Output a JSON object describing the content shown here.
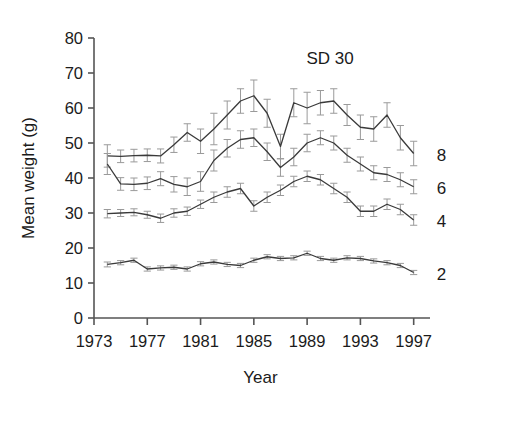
{
  "chart_data": {
    "type": "line",
    "title": "",
    "annotation": "SD 30",
    "xlabel": "Year",
    "ylabel": "Mean weight (g)",
    "xlim": [
      1973,
      1998
    ],
    "ylim": [
      0,
      80
    ],
    "ytick_values": [
      0,
      10,
      20,
      30,
      40,
      50,
      60,
      70,
      80
    ],
    "ytick_labels": [
      "0",
      "10",
      "20",
      "30",
      "40",
      "50",
      "60",
      "70",
      "80"
    ],
    "xtick_values": [
      1973,
      1977,
      1981,
      1985,
      1989,
      1993,
      1997
    ],
    "xtick_labels": [
      "1973",
      "1977",
      "1981",
      "1985",
      "1989",
      "1993",
      "1997"
    ],
    "grid": false,
    "legend_position": "right-of-axes",
    "error_bars": "vertical-capped",
    "x": [
      1974,
      1975,
      1976,
      1977,
      1978,
      1979,
      1980,
      1981,
      1982,
      1983,
      1984,
      1985,
      1986,
      1987,
      1988,
      1989,
      1990,
      1991,
      1992,
      1993,
      1994,
      1995,
      1996,
      1997
    ],
    "series": [
      {
        "name": "8",
        "label": "8",
        "values": [
          46.3,
          46.2,
          46.4,
          46.5,
          46.3,
          49.5,
          53.0,
          50.5,
          54.0,
          58.0,
          62.0,
          63.5,
          58.5,
          49.0,
          61.5,
          60.0,
          61.5,
          62.0,
          58.0,
          54.5,
          54.0,
          58.0,
          51.5,
          47.0
        ],
        "errors": [
          3.2,
          1.8,
          1.8,
          1.8,
          2.0,
          2.2,
          2.5,
          3.5,
          4.5,
          4.0,
          3.5,
          4.5,
          4.0,
          3.5,
          4.0,
          4.5,
          3.5,
          3.5,
          3.0,
          3.5,
          3.5,
          3.5,
          3.5,
          3.5
        ]
      },
      {
        "name": "6",
        "label": "6",
        "values": [
          44.0,
          38.3,
          38.2,
          38.5,
          39.8,
          38.2,
          37.5,
          39.0,
          45.0,
          48.5,
          51.0,
          51.5,
          47.5,
          43.0,
          46.0,
          50.0,
          51.5,
          50.0,
          46.5,
          44.0,
          41.5,
          41.0,
          39.5,
          37.5
        ],
        "errors": [
          3.0,
          1.8,
          1.8,
          1.8,
          2.0,
          2.2,
          2.5,
          2.8,
          3.0,
          2.5,
          2.5,
          2.5,
          2.5,
          2.5,
          2.5,
          2.5,
          2.0,
          2.0,
          2.0,
          2.0,
          2.0,
          2.0,
          2.0,
          2.0
        ]
      },
      {
        "name": "4",
        "label": "4",
        "values": [
          29.8,
          30.0,
          30.2,
          29.5,
          28.5,
          30.0,
          30.5,
          32.5,
          34.5,
          36.0,
          37.0,
          32.0,
          34.5,
          36.5,
          39.0,
          40.5,
          39.5,
          37.0,
          34.5,
          30.5,
          30.5,
          32.5,
          31.0,
          28.0
        ],
        "errors": [
          1.2,
          1.0,
          1.0,
          1.0,
          1.2,
          1.2,
          1.2,
          1.2,
          1.5,
          1.5,
          1.5,
          1.5,
          1.5,
          1.5,
          1.5,
          1.5,
          1.5,
          1.5,
          1.5,
          1.5,
          1.5,
          1.5,
          1.5,
          1.5
        ]
      },
      {
        "name": "2",
        "label": "2",
        "values": [
          15.3,
          15.8,
          16.5,
          14.0,
          14.3,
          14.5,
          14.0,
          15.5,
          16.0,
          15.3,
          15.0,
          16.5,
          17.5,
          17.0,
          17.2,
          18.5,
          17.0,
          16.5,
          17.2,
          17.0,
          16.3,
          15.8,
          15.0,
          13.0
        ],
        "errors": [
          0.7,
          0.6,
          0.6,
          0.6,
          0.6,
          0.6,
          0.6,
          0.6,
          0.6,
          0.6,
          0.6,
          0.6,
          0.6,
          0.6,
          0.6,
          0.6,
          0.6,
          0.6,
          0.6,
          0.6,
          0.6,
          0.6,
          0.6,
          0.6
        ]
      }
    ],
    "colors": {
      "line": "#3a3a3a",
      "error_bar": "#9a9a9a",
      "axis": "#555555",
      "text": "#1b1b1b",
      "background": "#ffffff"
    }
  }
}
